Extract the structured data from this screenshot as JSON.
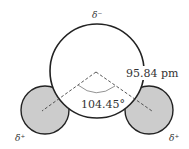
{
  "diagram": {
    "labels": {
      "oxygen_charge": "δ⁻",
      "hydrogen_left_charge": "δ⁺",
      "hydrogen_right_charge": "δ⁺",
      "bond_length": "95.84 pm",
      "bond_angle": "104.45°"
    },
    "colors": {
      "oxygen_fill": "#ffffff",
      "hydrogen_fill": "#cccccc",
      "outline": "#222222",
      "dash": "#444444",
      "angle_arc": "#777777"
    }
  }
}
